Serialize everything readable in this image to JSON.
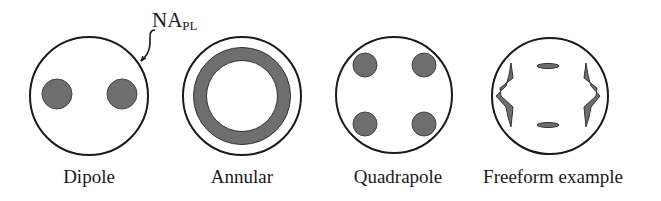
{
  "annotation": {
    "main": "NA",
    "sub": "PL"
  },
  "colors": {
    "stroke": "#1a1a1a",
    "fill": "#6e6e6e",
    "background": "#ffffff"
  },
  "illuminations": [
    {
      "name": "dipole",
      "label": "Dipole",
      "cx": 89,
      "cy": 96,
      "r": 59
    },
    {
      "name": "annular",
      "label": "Annular",
      "cx": 242,
      "cy": 96,
      "r": 59
    },
    {
      "name": "quadrapole",
      "label": "Quadrapole",
      "cx": 394,
      "cy": 95,
      "r": 58
    },
    {
      "name": "freeform",
      "label": "Freeform example",
      "cx": 550,
      "cy": 96,
      "r": 58
    }
  ]
}
